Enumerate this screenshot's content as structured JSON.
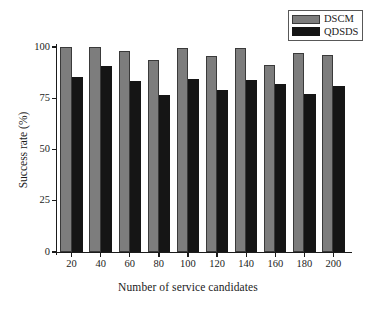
{
  "chart_data": {
    "type": "bar",
    "title": "",
    "xlabel": "Number of service candidates",
    "ylabel": "Success rate (%)",
    "categories": [
      "20",
      "40",
      "60",
      "80",
      "100",
      "120",
      "140",
      "160",
      "180",
      "200"
    ],
    "series": [
      {
        "name": "DSCM",
        "color": "#7d7d7d",
        "values": [
          100,
          100,
          98,
          93.5,
          99.5,
          95.5,
          99.5,
          91,
          97,
          96
        ]
      },
      {
        "name": "QDSDS",
        "color": "#151515",
        "values": [
          85.5,
          90.5,
          83.5,
          76.5,
          84.5,
          79,
          84,
          82,
          77,
          81
        ]
      }
    ],
    "ylim": [
      0,
      100
    ],
    "yticks": [
      "0",
      "25",
      "50",
      "75",
      "100"
    ],
    "ytick_values": [
      0,
      25,
      50,
      75,
      100
    ],
    "grid": false,
    "legend_position": "top-right"
  },
  "legend": {
    "entries": [
      {
        "label": "DSCM",
        "swatch": "gray-swatch"
      },
      {
        "label": "QDSDS",
        "swatch": "black-swatch"
      }
    ]
  },
  "axes": {
    "x_title": "Number of service candidates",
    "y_title": "Success rate (%)"
  }
}
